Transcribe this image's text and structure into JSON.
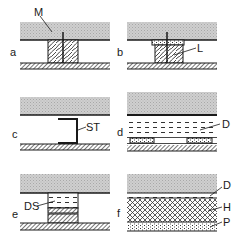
{
  "figure": {
    "panels": [
      {
        "id": "a",
        "label": "a",
        "annotations": [
          {
            "text": "M",
            "target": "slab"
          }
        ]
      },
      {
        "id": "b",
        "label": "b",
        "annotations": [
          {
            "text": "L",
            "target": "block"
          }
        ]
      },
      {
        "id": "c",
        "label": "c",
        "annotations": [
          {
            "text": "ST",
            "target": "bracket"
          }
        ]
      },
      {
        "id": "d",
        "label": "d",
        "annotations": [
          {
            "text": "D",
            "target": "insulation-layer"
          }
        ]
      },
      {
        "id": "e",
        "label": "e",
        "annotations": [
          {
            "text": "DS",
            "target": "damping-block"
          }
        ]
      },
      {
        "id": "f",
        "label": "f",
        "annotations": [
          {
            "text": "D",
            "target": "top-layer"
          },
          {
            "text": "H",
            "target": "middle-layer"
          },
          {
            "text": "P",
            "target": "bottom-layer"
          }
        ]
      }
    ]
  },
  "colors": {
    "slab": "#c8c8c8",
    "line": "#1a1a1a",
    "background": "#ffffff"
  }
}
